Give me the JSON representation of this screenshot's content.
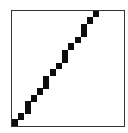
{
  "icon": {
    "name": "stepped-diagonal-line-icon",
    "frame": {
      "left": 11,
      "top": 10,
      "right": 124,
      "bottom": 126,
      "border_color": "#333333"
    },
    "fill_color": "#0d0d0d",
    "steps": [
      {
        "x": 93,
        "y": 11,
        "w": 6,
        "h": 6
      },
      {
        "x": 87,
        "y": 17,
        "w": 6,
        "h": 7
      },
      {
        "x": 81,
        "y": 24,
        "w": 6,
        "h": 13
      },
      {
        "x": 75,
        "y": 37,
        "w": 6,
        "h": 6
      },
      {
        "x": 68,
        "y": 43,
        "w": 6,
        "h": 7
      },
      {
        "x": 62,
        "y": 50,
        "w": 6,
        "h": 13
      },
      {
        "x": 56,
        "y": 63,
        "w": 6,
        "h": 6
      },
      {
        "x": 50,
        "y": 69,
        "w": 6,
        "h": 7
      },
      {
        "x": 43,
        "y": 76,
        "w": 6,
        "h": 13
      },
      {
        "x": 37,
        "y": 88,
        "w": 6,
        "h": 7
      },
      {
        "x": 31,
        "y": 95,
        "w": 6,
        "h": 7
      },
      {
        "x": 25,
        "y": 101,
        "w": 6,
        "h": 13
      },
      {
        "x": 18,
        "y": 113,
        "w": 6,
        "h": 7
      },
      {
        "x": 12,
        "y": 119,
        "w": 6,
        "h": 7
      }
    ]
  }
}
